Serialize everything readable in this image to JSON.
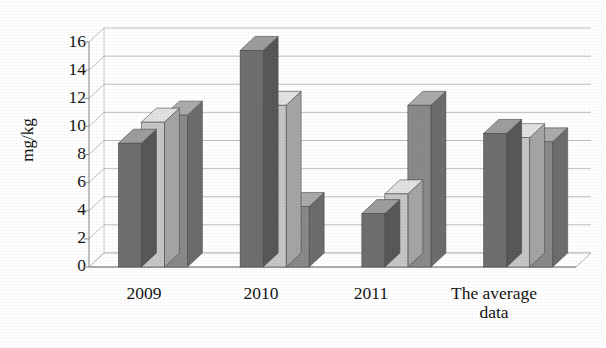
{
  "chart_data": {
    "type": "bar",
    "title": "",
    "subtitle": "",
    "xlabel": "",
    "ylabel": "mg/kg",
    "categories": [
      "2009",
      "2010",
      "2011",
      "The average data"
    ],
    "category_lines": [
      [
        "2009"
      ],
      [
        "2010"
      ],
      [
        "2011"
      ],
      [
        "The average",
        "data"
      ]
    ],
    "series": [
      {
        "name": "series-1",
        "color": "#6f6f6f",
        "values": [
          8.8,
          15.4,
          3.8,
          9.5
        ]
      },
      {
        "name": "series-2",
        "color": "#c2c2c2",
        "values": [
          10.3,
          11.5,
          5.2,
          9.2
        ]
      },
      {
        "name": "series-3",
        "color": "#8a8a8a",
        "values": [
          10.8,
          4.3,
          11.5,
          8.9
        ]
      }
    ],
    "ylim": [
      0,
      16
    ],
    "ytick_step": 2,
    "yticks": [
      "0",
      "2",
      "4",
      "6",
      "8",
      "10",
      "12",
      "14",
      "16"
    ],
    "grid": true,
    "grid_axis": "y",
    "legend": "none",
    "legend_position": "none",
    "style": "3d-grayscale-scan",
    "annotations": []
  },
  "colors": {
    "background": "#ffffff",
    "gridline": "#b4b4b4",
    "axis": "#8f8f8f",
    "text": "#141414",
    "series_1_front": "#6f6f6f",
    "series_1_top": "#9d9d9d",
    "series_1_side": "#575757",
    "series_2_front": "#c6c6c6",
    "series_2_top": "#e2e2e2",
    "series_3_front": "#8a8a8a",
    "series_3_top": "#ababab"
  }
}
